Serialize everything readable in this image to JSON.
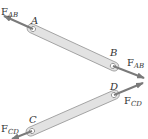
{
  "diagram": {
    "type": "two-force members free body diagram",
    "colors": {
      "member_fill": "#e2e2e2",
      "member_stroke": "#9a9a9a",
      "arrow": "#7a7a7a",
      "text": "#333333"
    },
    "members": [
      {
        "name": "AB",
        "end1": {
          "label": "A",
          "x": 33,
          "y": 29
        },
        "end2": {
          "label": "B",
          "x": 113,
          "y": 66
        },
        "force": {
          "symbol": "F",
          "subscript": "AB",
          "direction": "outward (tension)"
        }
      },
      {
        "name": "CD",
        "end1": {
          "label": "C",
          "x": 32,
          "y": 131
        },
        "end2": {
          "label": "D",
          "x": 114,
          "y": 95
        },
        "force": {
          "symbol": "F",
          "subscript": "CD",
          "direction": "outward (tension)"
        }
      }
    ],
    "labels": {
      "A": "A",
      "B": "B",
      "C": "C",
      "D": "D",
      "F": "F",
      "sub_AB": "AB",
      "sub_CD": "CD"
    }
  }
}
